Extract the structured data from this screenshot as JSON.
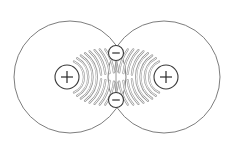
{
  "diagram": {
    "canvas": {
      "width": 230,
      "height": 142,
      "background": "#ffffff"
    },
    "colors": {
      "outline": "#6e6e6e",
      "charge_stroke": "#3a3a3a",
      "field_lines": "#9a9a9a",
      "bond": "#8a8a8a"
    },
    "large_circles": [
      {
        "name": "left-field-boundary",
        "cx": 70,
        "cy": 77,
        "r": 56
      },
      {
        "name": "right-field-boundary",
        "cx": 164,
        "cy": 77,
        "r": 56
      }
    ],
    "charges": [
      {
        "name": "left-positive-charge",
        "sign": "+",
        "cx": 67,
        "cy": 77,
        "r": 12
      },
      {
        "name": "right-positive-charge",
        "sign": "+",
        "cx": 166,
        "cy": 77,
        "r": 12
      },
      {
        "name": "top-negative-charge",
        "sign": "−",
        "cx": 116,
        "cy": 53,
        "r": 7.5
      },
      {
        "name": "bottom-negative-charge",
        "sign": "−",
        "cx": 116,
        "cy": 100,
        "r": 7.5
      }
    ],
    "bond": {
      "x1": 116,
      "y1": 60,
      "x2": 116,
      "y2": 93
    },
    "field_arcs": {
      "count_per_side": 9,
      "start_radius": 17,
      "spacing": 4.3,
      "gap_note": "arcs broken near horizontal midline toward center"
    },
    "labels": {
      "plus": "+",
      "minus": "−"
    }
  }
}
